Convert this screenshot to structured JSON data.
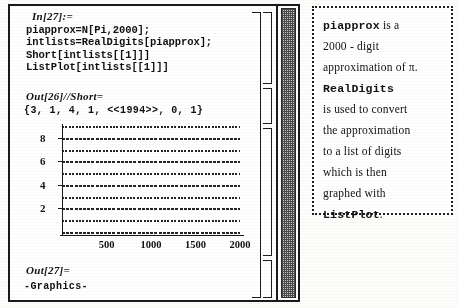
{
  "notebook": {
    "input_cell": {
      "label": "In[27]:=",
      "lines": [
        "piapprox=N[Pi,2000];",
        "intlists=RealDigits[piapprox];",
        "Short[intlists[[1]]]",
        "ListPlot[intlists[[1]]]"
      ]
    },
    "output_short": {
      "label": "Out[26]//Short=",
      "value": "{3, 1, 4, 1, <<1994>>, 0, 1}"
    },
    "output_graphics": {
      "label": "Out[27]=",
      "value": "-Graphics-"
    }
  },
  "chart_data": {
    "type": "scatter",
    "title": "",
    "xlabel": "",
    "ylabel": "",
    "xlim": [
      0,
      2000
    ],
    "ylim": [
      0,
      9
    ],
    "grid": false,
    "x_ticks": [
      500,
      1000,
      1500,
      2000
    ],
    "y_ticks": [
      2,
      4,
      6,
      8
    ],
    "series": [
      {
        "name": "digits of pi",
        "description": "ListPlot of the first 2000 digits of Pi; points fill all ten digit values 0-9 across index 1..2000",
        "digit_values": [
          0,
          1,
          2,
          3,
          4,
          5,
          6,
          7,
          8,
          9
        ],
        "points_total": 2000
      }
    ]
  },
  "annotation": {
    "lines": [
      [
        {
          "text": "piapprox",
          "style": "mono"
        },
        {
          "text": " is a",
          "style": "normal"
        }
      ],
      [
        {
          "text": "2000 - digit",
          "style": "normal"
        }
      ],
      [
        {
          "text": "approximation of π.",
          "style": "normal"
        }
      ],
      [
        {
          "text": "RealDigits",
          "style": "mono"
        }
      ],
      [
        {
          "text": "is used to convert",
          "style": "normal"
        }
      ],
      [
        {
          "text": "the approximation",
          "style": "normal"
        }
      ],
      [
        {
          "text": "to a list of digits",
          "style": "normal"
        }
      ],
      [
        {
          "text": "which is then",
          "style": "normal"
        }
      ],
      [
        {
          "text": "graphed with",
          "style": "normal"
        }
      ],
      [
        {
          "text": "ListPlot",
          "style": "mono"
        },
        {
          "text": ".",
          "style": "normal"
        }
      ]
    ]
  },
  "colors": {
    "ink": "#111111",
    "paper": "#ffffff",
    "scrollbar_track": "#c9c9c9"
  }
}
